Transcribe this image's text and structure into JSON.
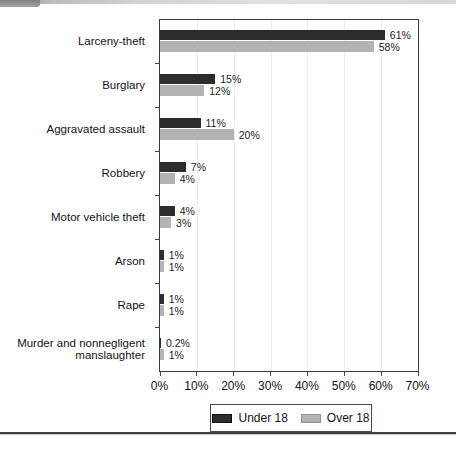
{
  "chart_data": {
    "type": "bar",
    "orientation": "horizontal",
    "title": "",
    "xlabel": "",
    "ylabel": "",
    "categories": [
      "Larceny-theft",
      "Burglary",
      "Aggravated assault",
      "Robbery",
      "Motor vehicle theft",
      "Arson",
      "Rape",
      "Murder and nonnegligent\nmanslaughter"
    ],
    "series": [
      {
        "name": "Under 18",
        "color": "#2d2d2d",
        "values": [
          61,
          15,
          11,
          7,
          4,
          1,
          1,
          0.2
        ],
        "labels": [
          "61%",
          "15%",
          "11%",
          "7%",
          "4%",
          "1%",
          "1%",
          "0.2%"
        ]
      },
      {
        "name": "Over 18",
        "color": "#b3b3b3",
        "values": [
          58,
          12,
          20,
          4,
          3,
          1,
          1,
          1
        ],
        "labels": [
          "58%",
          "12%",
          "20%",
          "4%",
          "3%",
          "1%",
          "1%",
          "1%"
        ]
      }
    ],
    "xlim": [
      0,
      70
    ],
    "x_ticks": [
      "0%",
      "10%",
      "20%",
      "30%",
      "40%",
      "50%",
      "60%",
      "70%"
    ],
    "grid": true,
    "legend_position": "bottom"
  },
  "legend": {
    "items": [
      {
        "label": "Under 18",
        "color": "#2d2d2d"
      },
      {
        "label": "Over 18",
        "color": "#b3b3b3"
      }
    ]
  },
  "colors": {
    "bar_under_18": "#2d2d2d",
    "bar_over_18": "#b3b3b3",
    "plot_border": "#3c3c3c",
    "gridline": "#ececec",
    "text": "#141414",
    "bottom_rule": "#3e3e3e"
  }
}
